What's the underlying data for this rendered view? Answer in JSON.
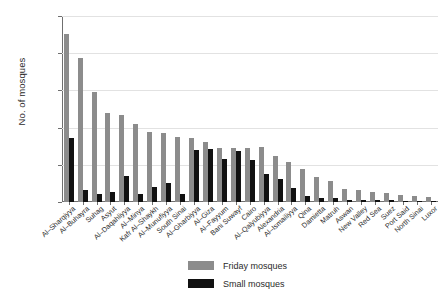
{
  "chart_data": {
    "type": "bar",
    "title": "",
    "xlabel": "",
    "ylabel": "No. of mosques",
    "ylim": [
      0,
      10000
    ],
    "yticks": [
      0,
      2000,
      4000,
      6000,
      8000,
      10000
    ],
    "ytick_labels": [
      "0",
      "2,000",
      "4,000",
      "6,000",
      "8,000",
      "10,000"
    ],
    "grid": true,
    "legend_position": "bottom-center",
    "categories": [
      "Al–Sharqiyya",
      "Al–Buhayra",
      "Suhag",
      "Asyut",
      "Al–Daqahliyya",
      "Al–Minya",
      "Kafr Al–Shaykh",
      "Al–Munufiyya",
      "South Sinai",
      "Al–Gharbiyya",
      "Al–Giza",
      "Al–Fayyum",
      "Bani Suwayf",
      "Cairo",
      "Al–Qalyubiyya",
      "Alexandria",
      "Al–Ismailiyya",
      "Qina",
      "Damietta",
      "Matruh",
      "Aswan",
      "New Valley",
      "Red Sea",
      "Suez",
      "Port Said",
      "North Sinai",
      "Luxor"
    ],
    "series": [
      {
        "name": "Friday mosques",
        "color": "#8c8c8c",
        "values": [
          9020,
          7750,
          5900,
          4780,
          4660,
          4180,
          3780,
          3720,
          3480,
          3460,
          3240,
          2880,
          2920,
          2880,
          2980,
          2470,
          2150,
          1750,
          1340,
          1120,
          720,
          640,
          520,
          470,
          360,
          300,
          250
        ]
      },
      {
        "name": "Small mosques",
        "color": "#111111",
        "values": [
          3420,
          620,
          420,
          540,
          1420,
          450,
          790,
          1030,
          440,
          2800,
          2860,
          2300,
          2760,
          2270,
          1480,
          1260,
          760,
          330,
          220,
          190,
          130,
          110,
          95,
          85,
          70,
          60,
          50
        ]
      }
    ],
    "legend": [
      {
        "label": "Friday mosques",
        "color": "#8c8c8c"
      },
      {
        "label": "Small mosques",
        "color": "#111111"
      }
    ]
  }
}
